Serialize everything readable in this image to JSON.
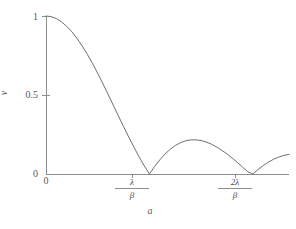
{
  "chart_data": {
    "type": "line",
    "title": "",
    "subtitle": "",
    "xlabel": "a",
    "ylabel": "v",
    "xlim": [
      0,
      2.35
    ],
    "ylim": [
      0,
      1.05
    ],
    "grid": false,
    "legend": null,
    "x_tick_labels": [
      "0",
      "λ/β",
      "2λ/β"
    ],
    "x_tick_values": [
      0,
      1,
      2
    ],
    "x_tick_numerators": [
      "",
      "λ",
      "2λ"
    ],
    "x_tick_denominators": [
      "",
      "β",
      "β"
    ],
    "y_tick_labels": [
      "0",
      "0.5",
      "1"
    ],
    "y_tick_values": [
      0,
      0.5,
      1
    ],
    "series": [
      {
        "name": "|sinc| visibility",
        "description": "Absolute value of sinc function: |sin(pi*x)/(pi*x)| plotted against a, zeros at lambda/beta and 2*lambda/beta",
        "x": [
          0.0,
          0.05,
          0.1,
          0.15,
          0.2,
          0.25,
          0.3,
          0.35,
          0.4,
          0.45,
          0.5,
          0.55,
          0.6,
          0.65,
          0.7,
          0.75,
          0.8,
          0.85,
          0.9,
          0.95,
          1.0,
          1.05,
          1.1,
          1.15,
          1.2,
          1.25,
          1.3,
          1.35,
          1.4,
          1.45,
          1.5,
          1.55,
          1.6,
          1.65,
          1.7,
          1.75,
          1.8,
          1.85,
          1.9,
          1.95,
          2.0,
          2.05,
          2.1,
          2.15,
          2.2,
          2.25,
          2.3,
          2.35
        ],
        "y": [
          1.0,
          0.996,
          0.984,
          0.963,
          0.935,
          0.9,
          0.858,
          0.81,
          0.757,
          0.7,
          0.637,
          0.572,
          0.505,
          0.436,
          0.368,
          0.3,
          0.234,
          0.171,
          0.109,
          0.052,
          0.0,
          0.047,
          0.089,
          0.126,
          0.156,
          0.18,
          0.198,
          0.21,
          0.216,
          0.216,
          0.212,
          0.202,
          0.189,
          0.171,
          0.15,
          0.127,
          0.101,
          0.073,
          0.044,
          0.015,
          0.0,
          0.028,
          0.053,
          0.075,
          0.093,
          0.107,
          0.118,
          0.124
        ]
      }
    ],
    "annotations": []
  },
  "figure": {
    "background_color": "#ffffff",
    "line_color": "#6e6e6e",
    "axis_color": "#8d8d8d",
    "text_color": "#5a5a5a"
  }
}
